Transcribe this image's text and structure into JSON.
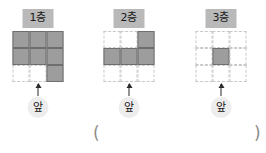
{
  "worksheet": {
    "panels": [
      {
        "floor_label": "1층",
        "front_label": "앞",
        "grid": {
          "rows": 3,
          "cols": 3,
          "cells": [
            [
              "filled",
              "filled",
              "filled"
            ],
            [
              "filled",
              "filled",
              "filled"
            ],
            [
              "empty",
              "empty",
              "filled"
            ]
          ],
          "filled_count": 7
        }
      },
      {
        "floor_label": "2층",
        "front_label": "앞",
        "grid": {
          "rows": 3,
          "cols": 3,
          "cells": [
            [
              "empty",
              "empty",
              "filled"
            ],
            [
              "filled",
              "filled",
              "filled"
            ],
            [
              "empty",
              "empty",
              "empty"
            ]
          ],
          "filled_count": 4
        }
      },
      {
        "floor_label": "3층",
        "front_label": "앞",
        "grid": {
          "rows": 3,
          "cols": 3,
          "cells": [
            [
              "empty",
              "empty",
              "empty"
            ],
            [
              "empty",
              "filled",
              "empty"
            ],
            [
              "empty",
              "empty",
              "empty"
            ]
          ],
          "filled_count": 1
        }
      }
    ],
    "answer_blank": {
      "open_paren": "(",
      "close_paren": ")",
      "value": ""
    },
    "colors": {
      "filled_cell": "#9d9d9d",
      "filled_cell_border": "#6e6e6e",
      "empty_cell_border": "#c9c9c9",
      "floor_badge_background": "#b9b9b9",
      "front_badge_background": "#ededed",
      "arrow": "#2b2b2b",
      "paren": "#8d8d8d"
    }
  }
}
